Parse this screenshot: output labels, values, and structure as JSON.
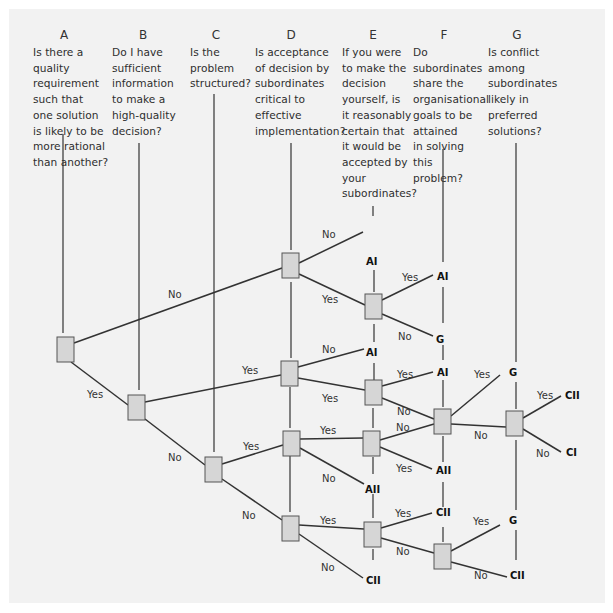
{
  "diagram": {
    "type": "decision-tree",
    "columns": [
      {
        "letter": "A",
        "x": 64,
        "question": "Is there a\nquality\nrequirement\nsuch that\none solution\nis likely to be\nmore rational\nthan another?"
      },
      {
        "letter": "B",
        "x": 143,
        "question": "Do I have\nsufficient\ninformation\nto make a\nhigh-quality\ndecision?"
      },
      {
        "letter": "C",
        "x": 216,
        "question": "Is the\nproblem\nstructured?"
      },
      {
        "letter": "D",
        "x": 291,
        "question": "Is acceptance\nof decision by\nsubordinates\ncritical to\neffective\nimplementation?"
      },
      {
        "letter": "E",
        "x": 373,
        "question": "If you were\nto make the\ndecision\nyourself, is\nit reasonably\ncertain that\nit would be\naccepted by\nyour\nsubordinates?"
      },
      {
        "letter": "F",
        "x": 444,
        "question": "Do\nsubordinates\nshare the\norganisational\ngoals to be\nattained\nin solving\nthis\nproblem?"
      },
      {
        "letter": "G",
        "x": 517,
        "question": "Is conflict\namong\nsubordinates\nlikely in\npreferred\nsolutions?"
      }
    ],
    "vlines": [
      {
        "x": 63,
        "y1": 134,
        "y2": 333
      },
      {
        "x": 139,
        "y1": 143,
        "y2": 390
      },
      {
        "x": 214,
        "y1": 94,
        "y2": 452
      },
      {
        "x": 291,
        "y1": 143,
        "y2": 250
      },
      {
        "x": 291,
        "y1": 282,
        "y2": 358
      },
      {
        "x": 290,
        "y1": 387,
        "y2": 428
      },
      {
        "x": 290,
        "y1": 456,
        "y2": 512
      },
      {
        "x": 373,
        "y1": 206,
        "y2": 216
      },
      {
        "x": 374,
        "y1": 270,
        "y2": 292
      },
      {
        "x": 374,
        "y1": 324,
        "y2": 342
      },
      {
        "x": 374,
        "y1": 363,
        "y2": 380
      },
      {
        "x": 373,
        "y1": 408,
        "y2": 428
      },
      {
        "x": 373,
        "y1": 457,
        "y2": 474
      },
      {
        "x": 373,
        "y1": 494,
        "y2": 518
      },
      {
        "x": 373,
        "y1": 549,
        "y2": 560
      },
      {
        "x": 443,
        "y1": 149,
        "y2": 262
      },
      {
        "x": 443,
        "y1": 287,
        "y2": 323
      },
      {
        "x": 443,
        "y1": 345,
        "y2": 360
      },
      {
        "x": 443,
        "y1": 380,
        "y2": 407
      },
      {
        "x": 443,
        "y1": 436,
        "y2": 462
      },
      {
        "x": 443,
        "y1": 482,
        "y2": 507
      },
      {
        "x": 443,
        "y1": 527,
        "y2": 542
      },
      {
        "x": 516,
        "y1": 143,
        "y2": 362
      },
      {
        "x": 516,
        "y1": 382,
        "y2": 409
      },
      {
        "x": 516,
        "y1": 440,
        "y2": 510
      },
      {
        "x": 516,
        "y1": 530,
        "y2": 560
      }
    ],
    "nodes": [
      {
        "id": "A",
        "x": 57,
        "y": 337
      },
      {
        "id": "B",
        "x": 128,
        "y": 395
      },
      {
        "id": "C",
        "x": 205,
        "y": 457
      },
      {
        "id": "D1",
        "x": 282,
        "y": 253
      },
      {
        "id": "D2",
        "x": 281,
        "y": 361
      },
      {
        "id": "D3",
        "x": 283,
        "y": 431
      },
      {
        "id": "D4",
        "x": 282,
        "y": 516
      },
      {
        "id": "E1",
        "x": 365,
        "y": 294
      },
      {
        "id": "E2",
        "x": 365,
        "y": 380
      },
      {
        "id": "E3",
        "x": 363,
        "y": 431
      },
      {
        "id": "E4",
        "x": 364,
        "y": 522
      },
      {
        "id": "F1",
        "x": 434,
        "y": 409
      },
      {
        "id": "F2",
        "x": 434,
        "y": 544
      },
      {
        "id": "G1",
        "x": 506,
        "y": 411
      }
    ],
    "edges": [
      {
        "x1": 74,
        "y1": 343,
        "x2": 282,
        "y2": 268,
        "label": "No",
        "lx": 168,
        "ly": 298
      },
      {
        "x1": 71,
        "y1": 362,
        "x2": 128,
        "y2": 405,
        "label": "Yes",
        "lx": 87,
        "ly": 398
      },
      {
        "x1": 145,
        "y1": 402,
        "x2": 281,
        "y2": 375,
        "label": "Yes",
        "lx": 242,
        "ly": 374
      },
      {
        "x1": 145,
        "y1": 419,
        "x2": 205,
        "y2": 465,
        "label": "No",
        "lx": 168,
        "ly": 461
      },
      {
        "x1": 299,
        "y1": 263,
        "x2": 363,
        "y2": 232,
        "label": "No",
        "lx": 322,
        "ly": 238
      },
      {
        "x1": 299,
        "y1": 274,
        "x2": 365,
        "y2": 305,
        "label": "Yes",
        "lx": 322,
        "ly": 303
      },
      {
        "x1": 382,
        "y1": 300,
        "x2": 433,
        "y2": 275,
        "label": "Yes",
        "lx": 402,
        "ly": 281
      },
      {
        "x1": 382,
        "y1": 314,
        "x2": 433,
        "y2": 336,
        "label": "No",
        "lx": 398,
        "ly": 340
      },
      {
        "x1": 298,
        "y1": 367,
        "x2": 364,
        "y2": 349,
        "label": "No",
        "lx": 322,
        "ly": 353
      },
      {
        "x1": 298,
        "y1": 378,
        "x2": 365,
        "y2": 390,
        "label": "Yes",
        "lx": 322,
        "ly": 402
      },
      {
        "x1": 382,
        "y1": 386,
        "x2": 433,
        "y2": 372,
        "label": "Yes",
        "lx": 397,
        "ly": 378
      },
      {
        "x1": 382,
        "y1": 398,
        "x2": 434,
        "y2": 419,
        "label": "No",
        "lx": 397,
        "ly": 415
      },
      {
        "x1": 222,
        "y1": 464,
        "x2": 283,
        "y2": 445,
        "label": "Yes",
        "lx": 243,
        "ly": 450
      },
      {
        "x1": 222,
        "y1": 479,
        "x2": 282,
        "y2": 520,
        "label": "No",
        "lx": 242,
        "ly": 519
      },
      {
        "x1": 300,
        "y1": 439,
        "x2": 363,
        "y2": 438,
        "label": "Yes",
        "lx": 320,
        "ly": 434
      },
      {
        "x1": 300,
        "y1": 448,
        "x2": 364,
        "y2": 484,
        "label": "No",
        "lx": 322,
        "ly": 482
      },
      {
        "x1": 380,
        "y1": 440,
        "x2": 434,
        "y2": 424,
        "label": "No",
        "lx": 396,
        "ly": 431
      },
      {
        "x1": 380,
        "y1": 447,
        "x2": 432,
        "y2": 469,
        "label": "Yes",
        "lx": 396,
        "ly": 472
      },
      {
        "x1": 451,
        "y1": 416,
        "x2": 500,
        "y2": 375,
        "label": "Yes",
        "lx": 474,
        "ly": 378
      },
      {
        "x1": 451,
        "y1": 424,
        "x2": 506,
        "y2": 427,
        "label": "No",
        "lx": 474,
        "ly": 439
      },
      {
        "x1": 523,
        "y1": 418,
        "x2": 561,
        "y2": 396,
        "label": "Yes",
        "lx": 537,
        "ly": 399
      },
      {
        "x1": 523,
        "y1": 429,
        "x2": 561,
        "y2": 452,
        "label": "No",
        "lx": 536,
        "ly": 457
      },
      {
        "x1": 299,
        "y1": 525,
        "x2": 364,
        "y2": 529,
        "label": "Yes",
        "lx": 320,
        "ly": 524
      },
      {
        "x1": 299,
        "y1": 534,
        "x2": 363,
        "y2": 578,
        "label": "No",
        "lx": 321,
        "ly": 571
      },
      {
        "x1": 381,
        "y1": 528,
        "x2": 432,
        "y2": 513,
        "label": "Yes",
        "lx": 395,
        "ly": 517
      },
      {
        "x1": 381,
        "y1": 538,
        "x2": 434,
        "y2": 553,
        "label": "No",
        "lx": 396,
        "ly": 555
      },
      {
        "x1": 451,
        "y1": 551,
        "x2": 500,
        "y2": 525,
        "label": "Yes",
        "lx": 473,
        "ly": 525
      },
      {
        "x1": 451,
        "y1": 562,
        "x2": 507,
        "y2": 577,
        "label": "No",
        "lx": 474,
        "ly": 579
      }
    ],
    "outcomes": [
      {
        "label": "AI",
        "x": 366,
        "y": 265
      },
      {
        "label": "AI",
        "x": 437,
        "y": 280
      },
      {
        "label": "G",
        "x": 436,
        "y": 343
      },
      {
        "label": "AI",
        "x": 366,
        "y": 356
      },
      {
        "label": "AI",
        "x": 437,
        "y": 376
      },
      {
        "label": "AII",
        "x": 365,
        "y": 493
      },
      {
        "label": "AII",
        "x": 436,
        "y": 474
      },
      {
        "label": "CII",
        "x": 436,
        "y": 516
      },
      {
        "label": "CII",
        "x": 366,
        "y": 584
      },
      {
        "label": "G",
        "x": 509,
        "y": 376
      },
      {
        "label": "CII",
        "x": 565,
        "y": 399
      },
      {
        "label": "CI",
        "x": 566,
        "y": 456
      },
      {
        "label": "G",
        "x": 509,
        "y": 524
      },
      {
        "label": "CII",
        "x": 510,
        "y": 579
      }
    ],
    "colors": {
      "panel": "#f2f2f2",
      "node_fill": "#d6d6d6",
      "node_stroke": "#555555",
      "line": "#333333"
    }
  }
}
